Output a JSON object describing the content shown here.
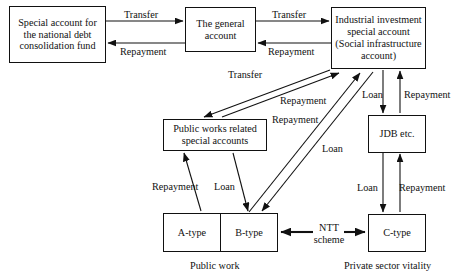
{
  "diagram": {
    "nodes": {
      "special_account": "Special account for the national debt consolidation fund",
      "general_account": "The general account",
      "industrial": "Industrial investment special account (Social infrastructure account)",
      "public_works": "Public works related special accounts",
      "jdb": "JDB etc.",
      "a_type": "A-type",
      "b_type": "B-type",
      "c_type": "C-type"
    },
    "edge_labels": {
      "transfer_1": "Transfer",
      "repayment_1": "Repayment",
      "transfer_2": "Transfer",
      "repayment_2": "Repayment",
      "transfer_3": "Transfer",
      "repayment_3": "Repayment",
      "repayment_4": "Repayment",
      "loan_1": "Loan",
      "loan_ind_jdb": "Loan",
      "repayment_jdb_ind": "Repayment",
      "loan_jdb_c": "Loan",
      "repayment_c_jdb": "Repayment",
      "repayment_pw": "Repayment",
      "loan_pw": "Loan",
      "ntt_scheme": "NTT scheme"
    },
    "captions": {
      "public_work": "Public work",
      "private_sector": "Private sector vitality"
    },
    "colors": {
      "stroke": "#111111",
      "background": "#ffffff"
    }
  }
}
